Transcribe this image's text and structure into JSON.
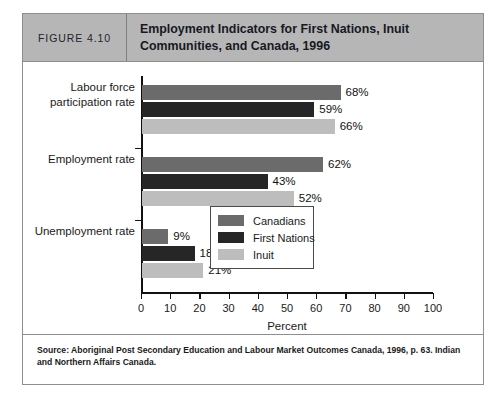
{
  "figure": {
    "number_label": "FIGURE 4.10",
    "title": "Employment Indicators for First Nations, Inuit Communities, and Canada, 1996",
    "source_note": "Source: Aboriginal Post Secondary Education and Labour Market Outcomes Canada, 1996, p. 63. Indian and Northern Affairs Canada."
  },
  "colors": {
    "header_band": "#b6b6b6",
    "canadians": "#6b6b6b",
    "first_nations": "#262626",
    "inuit": "#bdbdbd",
    "frame": "#8e8e8e",
    "axis": "#111111"
  },
  "chart_data": {
    "type": "bar",
    "orientation": "horizontal",
    "title": "Employment Indicators for First Nations, Inuit Communities, and Canada, 1996",
    "xlabel": "Percent",
    "ylabel": "",
    "xlim": [
      0,
      100
    ],
    "xticks": [
      0,
      10,
      20,
      30,
      40,
      50,
      60,
      70,
      80,
      90,
      100
    ],
    "grid": false,
    "legend_position": "inside-lower-right",
    "categories": [
      "Labour force\nparticipation rate",
      "Employment rate",
      "Unemployment rate"
    ],
    "series": [
      {
        "name": "Canadians",
        "color": "#6b6b6b",
        "values": [
          68,
          62,
          9
        ],
        "labels": [
          "68%",
          "62%",
          "9%"
        ]
      },
      {
        "name": "First Nations",
        "color": "#262626",
        "values": [
          59,
          43,
          18
        ],
        "labels": [
          "59%",
          "43%",
          "18%"
        ]
      },
      {
        "name": "Inuit",
        "color": "#bdbdbd",
        "values": [
          66,
          52,
          21
        ],
        "labels": [
          "66%",
          "52%",
          "21%"
        ]
      }
    ]
  }
}
